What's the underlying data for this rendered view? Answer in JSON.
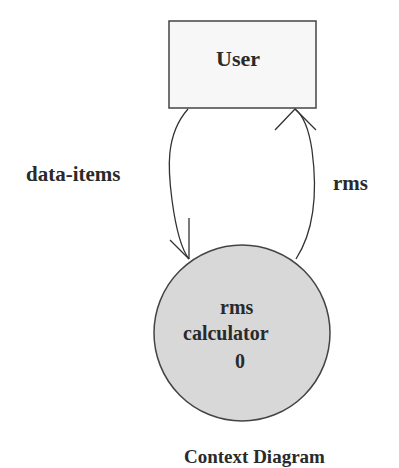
{
  "diagram": {
    "type": "context-diagram",
    "entity": {
      "label": "User",
      "fill": "#f7f7f7"
    },
    "process": {
      "lines": [
        "rms",
        "calculator",
        "0"
      ],
      "fill": "#d8d8d8"
    },
    "flows": [
      {
        "label": "data-items",
        "from": "User",
        "to": "rms calculator 0"
      },
      {
        "label": "rms",
        "from": "rms calculator 0",
        "to": "User"
      }
    ],
    "caption": "Context Diagram"
  }
}
